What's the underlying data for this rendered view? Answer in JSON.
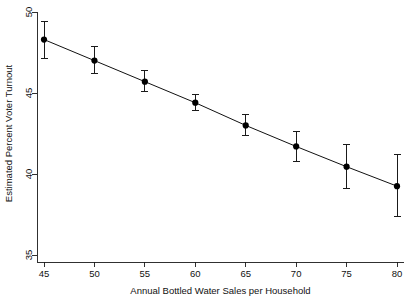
{
  "chart_data": {
    "type": "line",
    "title": "",
    "subtitle": "",
    "xlabel": "Annual Bottled Water Sales per Household",
    "ylabel": "Estimated Percent Voter Turnout",
    "xlim": [
      45,
      80
    ],
    "ylim": [
      35,
      50
    ],
    "xticks": [
      45,
      50,
      55,
      60,
      65,
      70,
      75,
      80
    ],
    "yticks": [
      35,
      40,
      45,
      50
    ],
    "xtick_labels": [
      "45",
      "50",
      "55",
      "60",
      "65",
      "70",
      "75",
      "80"
    ],
    "ytick_labels": [
      "35",
      "40",
      "45",
      "50"
    ],
    "grid": false,
    "legend": false,
    "legend_position": "none",
    "marker": "filled-circle",
    "error_bars": "vertical",
    "series": [
      {
        "name": "Estimated Percent Voter Turnout",
        "x": [
          45,
          50,
          55,
          60,
          65,
          70,
          75,
          80
        ],
        "values": [
          48.3,
          47.0,
          45.7,
          44.4,
          43.0,
          41.7,
          40.45,
          39.25
        ],
        "err_low": [
          47.1,
          46.2,
          45.1,
          43.9,
          42.4,
          40.8,
          39.1,
          37.4
        ],
        "err_high": [
          49.4,
          47.9,
          46.4,
          44.9,
          43.7,
          42.6,
          41.8,
          41.2
        ]
      }
    ],
    "annotations": []
  },
  "axes": {
    "x_title": "Annual Bottled Water Sales per Household",
    "y_title": "Estimated Percent Voter Turnout"
  },
  "colors": {
    "axis": "#1a1a1a",
    "line": "#111111",
    "marker": "#000000",
    "background": "#ffffff"
  }
}
